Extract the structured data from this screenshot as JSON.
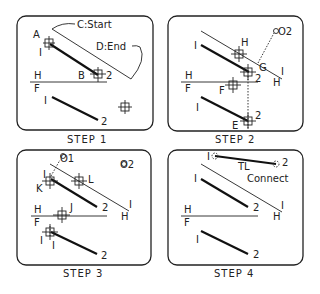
{
  "panels": [
    {
      "caption": "STEP 1",
      "labels": {
        "A": "A",
        "one_top": "I",
        "B": "B",
        "two_top": "2",
        "H": "H",
        "F": "F",
        "one_bottom": "I",
        "two_bottom": "2",
        "start": "C:Start",
        "end": "D:End"
      }
    },
    {
      "caption": "STEP 2",
      "labels": {
        "one_top": "I",
        "H_cross": "H",
        "circle2": "O2",
        "G": "G",
        "two_top": "2",
        "fold_one": "I",
        "fold_H": "H",
        "H": "H",
        "F": "F",
        "F_cross": "F",
        "one_bottom": "I",
        "two_bottom": "2",
        "E": "E"
      }
    },
    {
      "caption": "STEP 3",
      "labels": {
        "circle1": "O1",
        "circle2": "O2",
        "one_top": "I",
        "K": "K",
        "L": "L",
        "two_top": "2",
        "fold_one": "I",
        "fold_H": "H",
        "H": "H",
        "F": "F",
        "J": "J",
        "one_bottom_a": "I",
        "one_bottom_b": "I",
        "two_bottom": "2"
      }
    },
    {
      "caption": "STEP 4",
      "labels": {
        "tl_one": "I",
        "TL": "TL",
        "tl_two": "2",
        "connect": "Connect",
        "one_top": "I",
        "two_top": "2",
        "fold_one": "I",
        "fold_H": "H",
        "H": "H",
        "F": "F",
        "one_bottom": "I",
        "two_bottom": "2"
      }
    }
  ]
}
